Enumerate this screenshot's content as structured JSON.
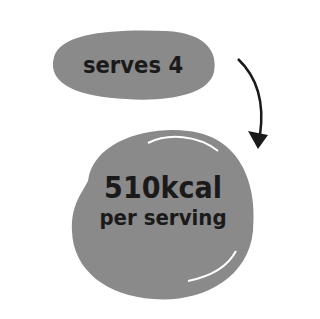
{
  "servings": {
    "label": "serves 4"
  },
  "calories": {
    "value": "510kcal",
    "unit_label": "per serving"
  },
  "colors": {
    "blob": "#8a8a8a",
    "text": "#1a1a1a",
    "arrow": "#1a1a1a"
  }
}
